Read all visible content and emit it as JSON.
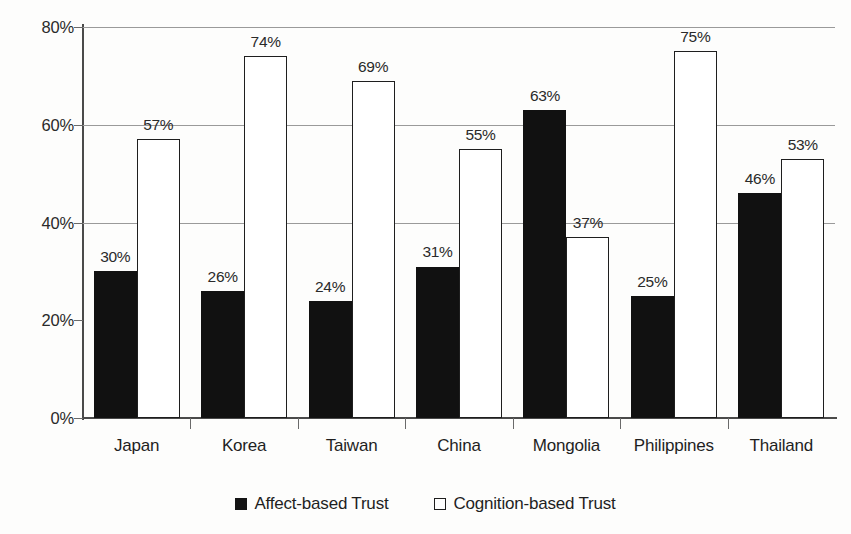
{
  "chart_data": {
    "type": "bar",
    "title": "",
    "subtitle": "",
    "xlabel": "",
    "ylabel": "",
    "ylim": [
      0,
      80
    ],
    "ytick_labels": [
      "0%",
      "20%",
      "40%",
      "60%",
      "80%"
    ],
    "ytick_values": [
      0,
      20,
      40,
      60,
      80
    ],
    "gridlines_at": [
      40,
      60,
      80
    ],
    "grid": true,
    "legend_position": "bottom-center",
    "value_suffix": "%",
    "categories": [
      "Japan",
      "Korea",
      "Taiwan",
      "China",
      "Mongolia",
      "Philippines",
      "Thailand"
    ],
    "series": [
      {
        "name": "Affect-based Trust",
        "style": "filled",
        "color": "#111111",
        "values": [
          30,
          26,
          24,
          31,
          63,
          25,
          46
        ],
        "labels": [
          "30%",
          "26%",
          "24%",
          "31%",
          "63%",
          "25%",
          "46%"
        ]
      },
      {
        "name": "Cognition-based Trust",
        "style": "hollow",
        "color": "#ffffff",
        "border_color": "#1e1e1e",
        "values": [
          57,
          74,
          69,
          55,
          37,
          75,
          53
        ],
        "labels": [
          "57%",
          "74%",
          "69%",
          "55%",
          "37%",
          "75%",
          "53%"
        ]
      }
    ]
  },
  "legend": {
    "items": [
      {
        "label": "Affect-based Trust",
        "style": "filled"
      },
      {
        "label": "Cognition-based Trust",
        "style": "hollow"
      }
    ]
  },
  "axes": {
    "y_labels": [
      "80%",
      "60%",
      "40%",
      "20%",
      "0%"
    ],
    "x_labels": [
      "Japan",
      "Korea",
      "Taiwan",
      "China",
      "Mongolia",
      "Philippines",
      "Thailand"
    ]
  },
  "colors": {
    "affect_fill": "#111111",
    "cognition_fill": "#ffffff",
    "cognition_border": "#1e1e1e",
    "axis": "#4a4a4a",
    "gridline": "#9a9a9a",
    "text": "#1f1f1f",
    "background": "#fdfdfc"
  }
}
